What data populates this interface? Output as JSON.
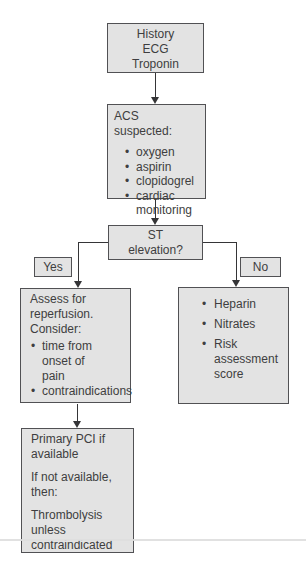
{
  "flowchart": {
    "colors": {
      "box_fill": "#e3e3e3",
      "box_border": "#515154",
      "text_color": "#3e3e40",
      "line_color": "#353537",
      "page_bg": "#ffffff"
    },
    "nodes": {
      "history": {
        "text": "History\nECG\nTroponin"
      },
      "acs": {
        "title": "ACS suspected:",
        "bullets": [
          "oxygen",
          "aspirin",
          "clopidogrel",
          "cardiac\nmonitoring"
        ]
      },
      "st_question": {
        "text": "ST\nelevation?"
      },
      "yes_branch": {
        "label": "Yes"
      },
      "no_branch": {
        "label": "No"
      },
      "assess": {
        "intro": "Assess for\nreperfusion.\nConsider:",
        "bullets": [
          "time from\nonset of\npain",
          "contraindications"
        ]
      },
      "treatment": {
        "bullets": [
          "Heparin",
          "Nitrates",
          "Risk\nassessment\nscore"
        ]
      },
      "pci": {
        "paragraphs": [
          "Primary PCI if\navailable",
          "If not available,\nthen:",
          "Thrombolysis\nunless\ncontraindicated"
        ]
      }
    }
  }
}
